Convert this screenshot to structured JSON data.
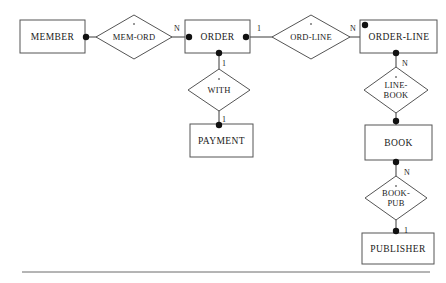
{
  "diagram": {
    "type": "entity-relationship-diagram",
    "notation": "chen",
    "entities": [
      {
        "id": "member",
        "label": "MEMBER",
        "x": 20,
        "y": 20,
        "w": 65,
        "h": 33
      },
      {
        "id": "order",
        "label": "ORDER",
        "x": 185,
        "y": 20,
        "w": 65,
        "h": 33
      },
      {
        "id": "order_line",
        "label": "ORDER-LINE",
        "x": 360,
        "y": 20,
        "w": 77,
        "h": 33
      },
      {
        "id": "payment",
        "label": "PAYMENT",
        "x": 190,
        "y": 124,
        "w": 63,
        "h": 33
      },
      {
        "id": "book",
        "label": "BOOK",
        "x": 365,
        "y": 125,
        "w": 67,
        "h": 35
      },
      {
        "id": "publisher",
        "label": "PUBLISHER",
        "x": 362,
        "y": 233,
        "w": 72,
        "h": 31
      }
    ],
    "relationships": [
      {
        "id": "mem_ord",
        "label": "MEM-ORD",
        "lines": [
          "MEM-ORD"
        ],
        "cx": 134,
        "cy": 37,
        "rx": 38,
        "ry": 22
      },
      {
        "id": "with",
        "label": "WITH",
        "lines": [
          "WITH"
        ],
        "cx": 219,
        "cy": 90,
        "rx": 31,
        "ry": 21
      },
      {
        "id": "ord_line",
        "label": "ORD-LINE",
        "lines": [
          "ORD-LINE"
        ],
        "cx": 311,
        "cy": 37,
        "rx": 39,
        "ry": 22
      },
      {
        "id": "line_book",
        "label": "LINE-BOOK",
        "lines": [
          "LINE-",
          "BOOK"
        ],
        "cx": 396,
        "cy": 90,
        "rx": 32,
        "ry": 23
      },
      {
        "id": "book_pub",
        "label": "BOOK-PUB",
        "lines": [
          "BOOK-",
          "PUB"
        ],
        "cx": 396,
        "cy": 198,
        "rx": 31,
        "ry": 22
      }
    ],
    "cardinalities": [
      {
        "id": "mem-ord-order-side",
        "value": "N",
        "x": 176,
        "y": 30
      },
      {
        "id": "order-ord-line-side",
        "value": "1",
        "x": 259,
        "y": 30
      },
      {
        "id": "ord-line-order-line-side",
        "value": "N",
        "x": 352,
        "y": 30
      },
      {
        "id": "order-with-side",
        "value": "1",
        "x": 224,
        "y": 65
      },
      {
        "id": "with-payment-side",
        "value": "1",
        "x": 224,
        "y": 120
      },
      {
        "id": "order-line-line-book",
        "value": "N",
        "x": 404,
        "y": 65
      },
      {
        "id": "book-book-pub-side",
        "value": "N",
        "x": 406,
        "y": 173
      },
      {
        "id": "book-pub-publisher-side",
        "value": "1",
        "x": 406,
        "y": 231
      }
    ],
    "connectors": [
      {
        "id": "member-to-mem-ord",
        "points": "85,37 96,37",
        "dot": {
          "x": 87,
          "y": 37
        }
      },
      {
        "id": "mem-ord-to-order",
        "points": "172,37 185,37",
        "dot": {
          "x": 187,
          "y": 37
        }
      },
      {
        "id": "order-to-ord-line",
        "points": "250,37 272,37",
        "dot": {
          "x": 248,
          "y": 37
        }
      },
      {
        "id": "ord-line-to-order-line",
        "points": "350,37 360,37",
        "dot": {
          "x": 364,
          "y": 25
        }
      },
      {
        "id": "order-to-with",
        "points": "219,53 219,69",
        "dot": {
          "x": 219,
          "y": 53
        }
      },
      {
        "id": "with-to-payment",
        "points": "219,111 219,124",
        "dot": {
          "x": 219,
          "y": 126
        }
      },
      {
        "id": "order-line-to-line-book",
        "points": "396,53 396,67",
        "dot": {
          "x": 396,
          "y": 53
        }
      },
      {
        "id": "line-book-to-book",
        "points": "396,113 396,125",
        "dot": {
          "x": 396,
          "y": 122
        }
      },
      {
        "id": "book-to-book-pub",
        "points": "396,160 396,176",
        "dot": {
          "x": 396,
          "y": 162
        }
      },
      {
        "id": "book-pub-to-publisher",
        "points": "396,220 396,233",
        "dot": {
          "x": 396,
          "y": 231
        }
      }
    ],
    "footer_rule": {
      "x1": 22,
      "y1": 272,
      "x2": 430,
      "y2": 272
    }
  }
}
